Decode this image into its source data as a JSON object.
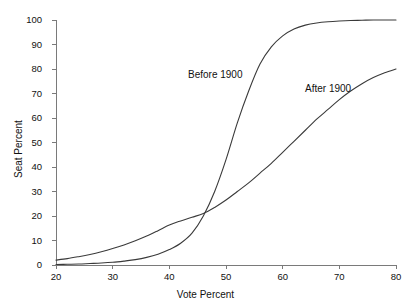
{
  "chart_data": {
    "type": "line",
    "title": "",
    "xlabel": "Vote Percent",
    "ylabel": "Seat Percent",
    "xlim": [
      20,
      80
    ],
    "ylim": [
      0,
      100
    ],
    "xticks": [
      "20",
      "30",
      "40",
      "50",
      "60",
      "70",
      "80"
    ],
    "yticks": [
      "0",
      "10",
      "20",
      "30",
      "40",
      "50",
      "60",
      "70",
      "80",
      "90",
      "100"
    ],
    "grid": false,
    "legend_position": "inline-annotations",
    "annotations": [
      {
        "text": "Before 1900",
        "x": 47,
        "y": 74
      },
      {
        "text": "After 1900",
        "x": 66,
        "y": 70
      }
    ],
    "line_color": "#3a3a3a",
    "axis_color": "#7a7a7a",
    "series": [
      {
        "name": "Before 1900",
        "x": [
          20,
          22,
          24,
          26,
          28,
          30,
          32,
          34,
          36,
          38,
          40,
          42,
          44,
          46,
          48,
          50,
          52,
          54,
          56,
          58,
          60,
          62,
          64,
          66,
          68,
          70,
          72,
          74,
          76,
          78,
          80
        ],
        "values": [
          0.2,
          0.3,
          0.4,
          0.6,
          0.8,
          1.1,
          1.6,
          2.2,
          3.1,
          4.4,
          6.3,
          8.9,
          13.0,
          20.0,
          30.0,
          43.0,
          58.0,
          71.0,
          82.0,
          89.0,
          93.5,
          96.3,
          97.9,
          98.8,
          99.3,
          99.6,
          99.8,
          99.9,
          100.0,
          100.0,
          100.0
        ]
      },
      {
        "name": "After 1900",
        "x": [
          20,
          22,
          24,
          26,
          28,
          30,
          32,
          34,
          36,
          38,
          40,
          42,
          44,
          46,
          48,
          50,
          52,
          54,
          56,
          58,
          60,
          62,
          64,
          66,
          68,
          70,
          72,
          74,
          76,
          78,
          80
        ],
        "values": [
          2.0,
          2.6,
          3.4,
          4.3,
          5.4,
          6.7,
          8.2,
          9.9,
          11.8,
          14.0,
          16.3,
          18.0,
          19.5,
          21.0,
          23.5,
          26.5,
          30.0,
          33.5,
          37.5,
          41.5,
          46.0,
          50.5,
          55.0,
          59.5,
          63.5,
          67.5,
          71.0,
          74.0,
          76.5,
          78.5,
          80.0
        ]
      }
    ]
  }
}
